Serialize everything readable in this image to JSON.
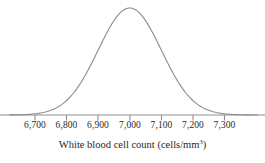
{
  "figure": {
    "axis_title_main": "White blood cell count (cells/mm",
    "axis_title_sup": "3",
    "axis_title_close": ")",
    "axis_title_full": "White blood cell count (cells/mm3)"
  },
  "chart_data": {
    "type": "line",
    "title": "",
    "xlabel": "White blood cell count (cells/mm3)",
    "ylabel": "",
    "curve": "normal-distribution-bell-curve",
    "mean": 7000,
    "std_dev": 100,
    "xlim": [
      6640,
      7360
    ],
    "tick_values": [
      6700,
      6800,
      6900,
      7000,
      7100,
      7200,
      7300
    ],
    "tick_labels": [
      "6,700",
      "6,800",
      "6,900",
      "7,000",
      "7,100",
      "7,200",
      "7,300"
    ],
    "tick_positions_px": [
      35,
      66.5,
      98,
      130,
      161.5,
      193,
      224.5
    ],
    "grid": false,
    "legend": false,
    "axis_y_px": 115,
    "peak_y_px": 8,
    "colors": {
      "curve": "#8c8c8c",
      "axis": "#8f8f8f",
      "text": "#1f1f1f"
    }
  }
}
